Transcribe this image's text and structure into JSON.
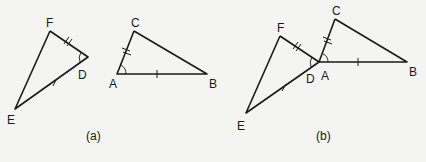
{
  "figures": [
    {
      "caption": "(a)",
      "labels": {
        "F": "F",
        "D": "D",
        "E": "E",
        "C": "C",
        "A": "A",
        "B": "B"
      },
      "description": "Two separate triangles DEF and ABC with FD = CA (double tick), DE = AB (single tick), angle D = angle A"
    },
    {
      "caption": "(b)",
      "labels": {
        "F": "F",
        "D": "D",
        "E": "E",
        "C": "C",
        "A": "A",
        "B": "B"
      },
      "description": "Triangle DEF placed with D coinciding with A of triangle ABC"
    }
  ]
}
